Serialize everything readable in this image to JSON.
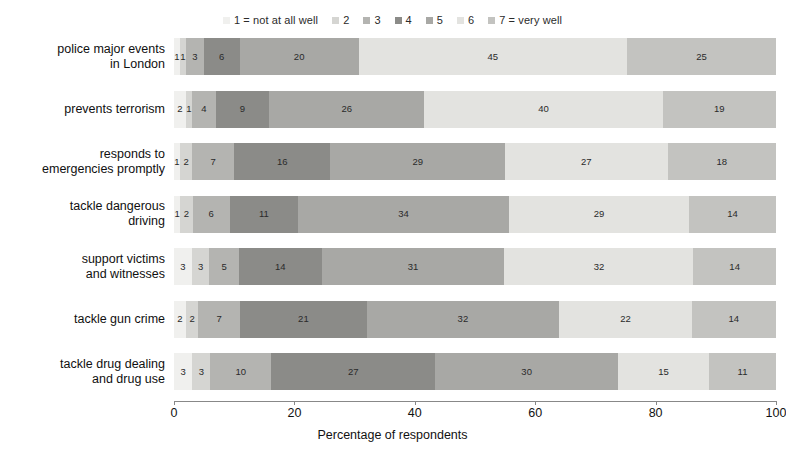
{
  "chart_data": {
    "type": "bar",
    "orientation": "horizontal",
    "stacked": true,
    "stack_mode": "percent",
    "title": "",
    "xlabel": "Percentage of respondents",
    "ylabel": "",
    "xlim": [
      0,
      100
    ],
    "xticks": [
      0,
      20,
      40,
      60,
      80,
      100
    ],
    "xtick_labels": [
      "0",
      "20",
      "40",
      "60",
      "80",
      "100"
    ],
    "grid": false,
    "legend_position": "top-center",
    "categories": [
      "police major events in London",
      "prevents terrorism",
      "responds to emergencies promptly",
      "tackle dangerous driving",
      "support victims and witnesses",
      "tackle gun crime",
      "tackle drug dealing and drug use"
    ],
    "category_lines": [
      [
        "police major events",
        "in London"
      ],
      [
        "prevents terrorism"
      ],
      [
        "responds to",
        "emergencies promptly"
      ],
      [
        "tackle dangerous",
        "driving"
      ],
      [
        "support victims",
        "and witnesses"
      ],
      [
        "tackle gun crime"
      ],
      [
        "tackle drug dealing",
        "and drug use"
      ]
    ],
    "series": [
      {
        "name": "1 = not at all well",
        "short": "1",
        "color": "#f0f0ee",
        "values": [
          1,
          2,
          1,
          1,
          3,
          2,
          3
        ]
      },
      {
        "name": "2",
        "short": "2",
        "color": "#d5d5d2",
        "values": [
          1,
          1,
          2,
          2,
          3,
          2,
          3
        ]
      },
      {
        "name": "3",
        "short": "3",
        "color": "#b4b4b1",
        "values": [
          3,
          4,
          7,
          6,
          5,
          7,
          10
        ]
      },
      {
        "name": "4",
        "short": "4",
        "color": "#8b8b88",
        "values": [
          6,
          9,
          16,
          11,
          14,
          21,
          27
        ]
      },
      {
        "name": "5",
        "short": "5",
        "color": "#a8a8a5",
        "values": [
          20,
          26,
          29,
          34,
          31,
          32,
          30
        ]
      },
      {
        "name": "6",
        "short": "6",
        "color": "#e3e3e0",
        "values": [
          45,
          40,
          27,
          29,
          32,
          22,
          15
        ]
      },
      {
        "name": "7 = very well",
        "short": "7",
        "color": "#c3c3c0",
        "values": [
          25,
          19,
          18,
          14,
          14,
          14,
          11
        ]
      }
    ],
    "bar_labels": [
      [
        "1",
        "1",
        "3",
        "6",
        "20",
        "45",
        "25"
      ],
      [
        "2",
        "1",
        "4",
        "9",
        "26",
        "40",
        "19"
      ],
      [
        "1",
        "2",
        "7",
        "16",
        "29",
        "27",
        "18"
      ],
      [
        "1",
        "2",
        "6",
        "11",
        "34",
        "29",
        "14"
      ],
      [
        "3",
        "3",
        "5",
        "14",
        "31",
        "32",
        "14"
      ],
      [
        "2",
        "2",
        "7",
        "21",
        "32",
        "22",
        "14"
      ],
      [
        "3",
        "3",
        "10",
        "27",
        "30",
        "15",
        "11"
      ]
    ]
  },
  "legend": {
    "items": [
      {
        "marker": "legend-swatch-1",
        "label": "1 = not at all well",
        "color": "#f0f0ee"
      },
      {
        "marker": "legend-swatch-2",
        "label": "2",
        "color": "#d5d5d2"
      },
      {
        "marker": "legend-swatch-3",
        "label": "3",
        "color": "#b4b4b1"
      },
      {
        "marker": "legend-swatch-4",
        "label": "4",
        "color": "#8b8b88"
      },
      {
        "marker": "legend-swatch-5",
        "label": "5",
        "color": "#a8a8a5"
      },
      {
        "marker": "legend-swatch-6",
        "label": "6",
        "color": "#e3e3e0"
      },
      {
        "marker": "legend-swatch-7",
        "label": "7 = very well",
        "color": "#c3c3c0"
      }
    ]
  },
  "axis": {
    "x_title": "Percentage of respondents",
    "tick_labels": [
      "0",
      "20",
      "40",
      "60",
      "80",
      "100"
    ],
    "axis_color": "#888888"
  },
  "colors": {
    "background": "#ffffff",
    "text": "#111111",
    "axis": "#888888"
  }
}
